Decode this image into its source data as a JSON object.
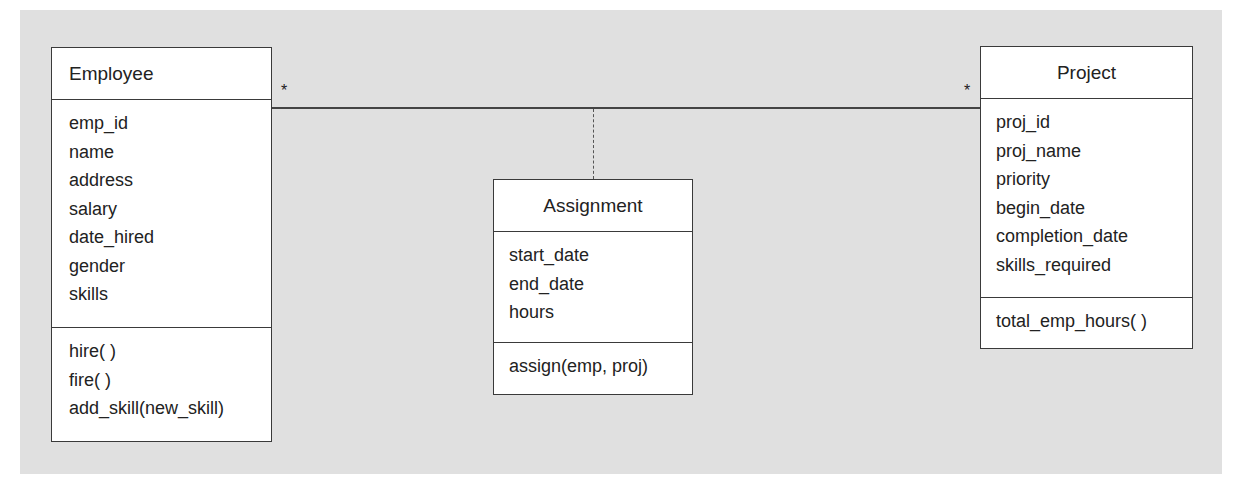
{
  "diagram": {
    "type": "UML class diagram",
    "background_color": "#e0e0e0",
    "classes": {
      "employee": {
        "name": "Employee",
        "attributes": [
          "emp_id",
          "name",
          "address",
          "salary",
          "date_hired",
          "gender",
          "skills"
        ],
        "operations": [
          "hire( )",
          "fire( )",
          "add_skill(new_skill)"
        ]
      },
      "assignment": {
        "name": "Assignment",
        "attributes": [
          "start_date",
          "end_date",
          "hours"
        ],
        "operations": [
          "assign(emp, proj)"
        ]
      },
      "project": {
        "name": "Project",
        "attributes": [
          "proj_id",
          "proj_name",
          "priority",
          "begin_date",
          "completion_date",
          "skills_required"
        ],
        "operations": [
          "total_emp_hours( )"
        ]
      }
    },
    "association": {
      "from": "Employee",
      "to": "Project",
      "multiplicity_left": "*",
      "multiplicity_right": "*",
      "association_class": "Assignment"
    }
  }
}
